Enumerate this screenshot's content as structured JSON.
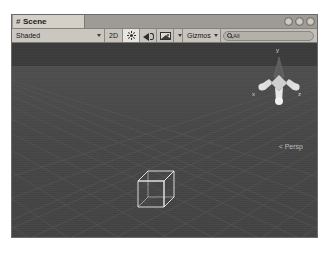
{
  "window": {
    "controls": [
      {
        "name": "minimize-button"
      },
      {
        "name": "maximize-button"
      },
      {
        "name": "close-button"
      }
    ]
  },
  "tab": {
    "icon": "hash-icon",
    "hash": "#",
    "label": "Scene"
  },
  "toolbar": {
    "draw_mode": {
      "label": "Shaded",
      "icon": "chevron-down-icon"
    },
    "two_d_toggle": {
      "label": "2D",
      "active": false
    },
    "lighting_toggle": {
      "icon": "sun-icon",
      "label": "",
      "active": true
    },
    "audio_toggle": {
      "icon": "audio-icon",
      "label": ""
    },
    "effects_toggle": {
      "icon": "image-effects-icon",
      "label": ""
    },
    "effects_dropdown": {
      "icon": "chevron-down-icon"
    },
    "gizmos": {
      "label": "Gizmos",
      "icon": "chevron-down-icon"
    },
    "search": {
      "icon": "search-icon",
      "value": "All",
      "placeholder": "All"
    }
  },
  "viewport": {
    "camera_label": "Persp",
    "camera_prefix": "<",
    "gizmo": {
      "axis_y": "y",
      "axis_x": "x",
      "axis_z": "z"
    },
    "objects": [
      {
        "name": "wireframe-cube",
        "type": "cube"
      }
    ]
  },
  "colors": {
    "chrome": "#c3bfb8",
    "tab_active": "#d4d0c8",
    "viewport_sky": "#3c3c3c",
    "viewport_ground": "#4a4a4a",
    "grid_line": "#5a5a5a",
    "wire": "#e8e8e8",
    "gizmo_y": "#6b6b6b",
    "gizmo_xz": "#d6d6d6"
  }
}
